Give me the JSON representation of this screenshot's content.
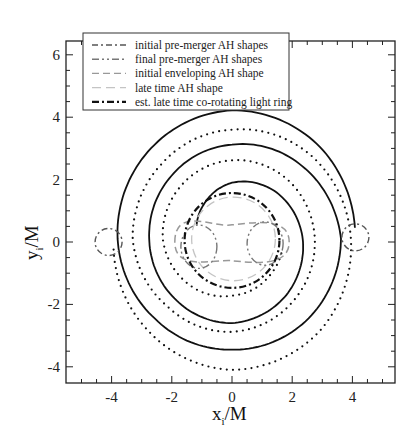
{
  "chart_data": {
    "type": "line",
    "title": "",
    "xlabel": "x_i/M",
    "ylabel": "y_i/M",
    "xlim": [
      -5.5,
      5.4
    ],
    "ylim": [
      -4.5,
      6.45
    ],
    "xticks": [
      -4,
      -2,
      0,
      2,
      4
    ],
    "yticks": [
      -4,
      -2,
      0,
      2,
      4,
      6
    ],
    "grid": false,
    "legend_position": "upper-left",
    "legend": [
      {
        "label": "initial pre-merger AH shapes",
        "style": "dash-dot",
        "color": "#555555"
      },
      {
        "label": "final pre-merger AH shapes",
        "style": "dash-dot-dot",
        "color": "#777777"
      },
      {
        "label": "initial enveloping AH shape",
        "style": "dashed",
        "color": "#999999"
      },
      {
        "label": "late time AH shape",
        "style": "long-dash",
        "color": "#c4c4c4"
      },
      {
        "label": "est. late time co-rotating light ring",
        "style": "bold-dash-dot",
        "color": "#111111"
      }
    ],
    "series": [
      {
        "name": "BH 1 trajectory",
        "style": "solid",
        "center": [
          0,
          0.1
        ],
        "polar_points": [
          [
            5,
            4.1
          ],
          [
            45,
            4.15
          ],
          [
            90,
            4.12
          ],
          [
            135,
            3.95
          ],
          [
            180,
            3.8
          ],
          [
            225,
            3.62
          ],
          [
            270,
            3.55
          ],
          [
            315,
            3.6
          ],
          [
            360,
            3.62
          ],
          [
            405,
            3.3
          ],
          [
            450,
            3.02
          ],
          [
            495,
            2.85
          ],
          [
            540,
            2.75
          ],
          [
            585,
            2.7
          ],
          [
            630,
            2.7
          ],
          [
            675,
            2.55
          ],
          [
            720,
            2.35
          ],
          [
            765,
            2.1
          ],
          [
            810,
            1.8
          ],
          [
            850,
            1.45
          ],
          [
            880,
            1.25
          ]
        ]
      },
      {
        "name": "BH 2 trajectory",
        "style": "dotted",
        "center": [
          0,
          0.1
        ],
        "polar_points": [
          [
            185,
            3.95
          ],
          [
            225,
            4.05
          ],
          [
            270,
            4.2
          ],
          [
            315,
            4.15
          ],
          [
            360,
            3.95
          ],
          [
            405,
            3.75
          ],
          [
            450,
            3.5
          ],
          [
            495,
            3.35
          ],
          [
            540,
            3.3
          ],
          [
            585,
            3.05
          ],
          [
            630,
            2.98
          ],
          [
            675,
            2.85
          ],
          [
            720,
            2.75
          ],
          [
            765,
            2.65
          ],
          [
            810,
            2.52
          ],
          [
            855,
            2.4
          ],
          [
            900,
            2.3
          ],
          [
            945,
            2.05
          ],
          [
            990,
            1.82
          ],
          [
            1035,
            1.72
          ],
          [
            1070,
            1.7
          ]
        ]
      }
    ],
    "shapes": {
      "initial_pre_merger_AH": [
        {
          "cx": 4.1,
          "cy": 0.15,
          "r": 0.45
        },
        {
          "cx": -4.1,
          "cy": 0.0,
          "r": 0.45
        }
      ],
      "final_pre_merger_AH": [
        {
          "cx": -1.1,
          "cy": -0.15,
          "rx": 0.6,
          "ry": 0.7
        },
        {
          "cx": 1.1,
          "cy": -0.05,
          "rx": 0.6,
          "ry": 0.7
        }
      ],
      "initial_enveloping_AH": {
        "cx": 0.0,
        "cy": 0.0,
        "rx": 1.9,
        "ry": 0.85
      },
      "late_time_AH": {
        "cx": 0.05,
        "cy": 0.1,
        "r": 1.35
      },
      "light_ring": {
        "cx": 0.0,
        "cy": 0.05,
        "r": 1.55
      }
    }
  }
}
